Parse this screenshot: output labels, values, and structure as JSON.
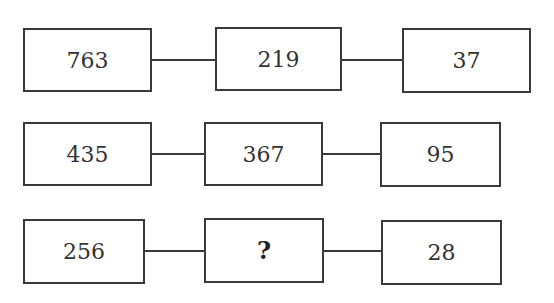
{
  "rows": [
    {
      "left": "763",
      "middle": "219",
      "right": "37"
    },
    {
      "left": "435",
      "middle": "367",
      "right": "95"
    },
    {
      "left": "256",
      "middle": "?",
      "right": "28"
    }
  ]
}
